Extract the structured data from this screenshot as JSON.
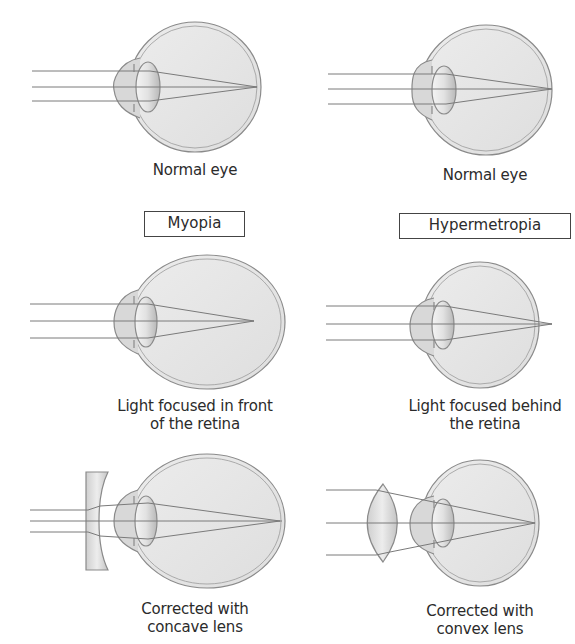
{
  "colors": {
    "stroke": "#8a8a8a",
    "ray": "#7a7a7a",
    "eye_fill": "#e6e6e6",
    "cornea_fill": "#d6d6d6",
    "lens_fill": "#dcdcdc",
    "text": "#2b2b2b"
  },
  "headings": {
    "left": "Myopia",
    "right": "Hypermetropia"
  },
  "panels": {
    "normal_left": {
      "caption": "Normal eye"
    },
    "normal_right": {
      "caption": "Normal eye"
    },
    "myopia": {
      "caption_line1": "Light focused in front",
      "caption_line2": "of the retina"
    },
    "hypermetropia": {
      "caption_line1": "Light focused behind",
      "caption_line2": "the retina"
    },
    "myopia_corrected": {
      "caption_line1": "Corrected with",
      "caption_line2": "concave lens"
    },
    "hypermetropia_corrected": {
      "caption_line1": "Corrected with",
      "caption_line2": "convex lens"
    }
  }
}
